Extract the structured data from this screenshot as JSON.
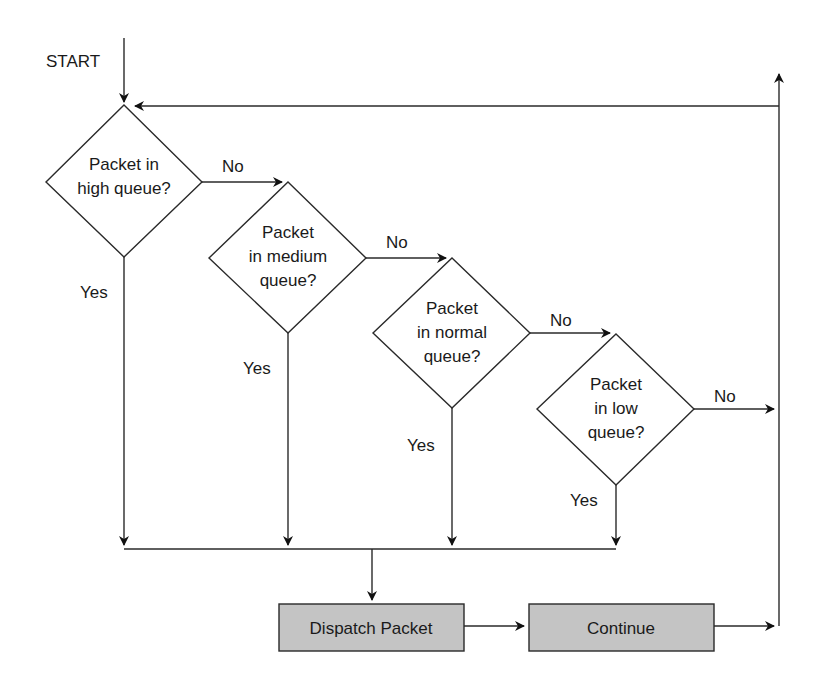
{
  "diagram": {
    "type": "flowchart",
    "start_label": "START",
    "decisions": [
      {
        "id": "high",
        "lines": [
          "Packet in",
          "high queue?"
        ]
      },
      {
        "id": "medium",
        "lines": [
          "Packet",
          "in medium",
          "queue?"
        ]
      },
      {
        "id": "normal",
        "lines": [
          "Packet",
          "in normal",
          "queue?"
        ]
      },
      {
        "id": "low",
        "lines": [
          "Packet",
          "in low",
          "queue?"
        ]
      }
    ],
    "yes_label": "Yes",
    "no_label": "No",
    "processes": [
      {
        "id": "dispatch",
        "label": "Dispatch Packet"
      },
      {
        "id": "continue",
        "label": "Continue"
      }
    ],
    "colors": {
      "line": "#2a2a2a",
      "process_fill": "#c4c4c4",
      "background": "#ffffff"
    }
  }
}
